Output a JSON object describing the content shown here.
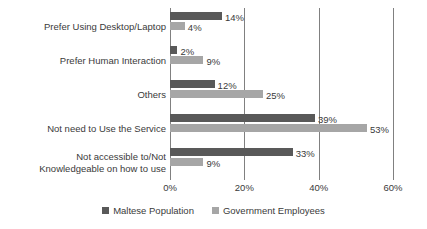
{
  "chart_data": {
    "type": "bar",
    "orientation": "horizontal",
    "title": "",
    "xlabel": "",
    "ylabel": "",
    "xlim": [
      0,
      60
    ],
    "xticks": [
      "0%",
      "20%",
      "40%",
      "60%"
    ],
    "xtick_values": [
      0,
      20,
      40,
      60
    ],
    "grid": true,
    "legend_position": "bottom",
    "categories": [
      "Prefer Using Desktop/Laptop",
      "Prefer Human Interaction",
      "Others",
      "Not need to Use the Service",
      "Not accessible to/Not\nKnowledgeable on how to use"
    ],
    "series": [
      {
        "name": "Maltese Population",
        "color": "#595959",
        "values": [
          14,
          2,
          12,
          39,
          33
        ],
        "labels": [
          "14%",
          "2%",
          "12%",
          "39%",
          "33%"
        ]
      },
      {
        "name": "Government Employees",
        "color": "#a6a6a6",
        "values": [
          4,
          9,
          25,
          53,
          9
        ],
        "labels": [
          "4%",
          "9%",
          "25%",
          "53%",
          "9%"
        ]
      }
    ]
  }
}
